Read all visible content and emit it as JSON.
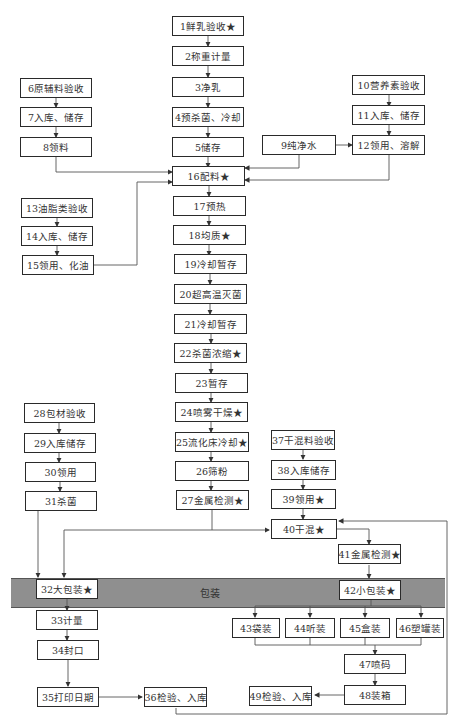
{
  "diagram": {
    "band_label": "包装",
    "nodes": [
      {
        "id": 1,
        "label": "1鲜乳验收★"
      },
      {
        "id": 2,
        "label": "2称重计量"
      },
      {
        "id": 3,
        "label": "3净乳"
      },
      {
        "id": 4,
        "label": "4预杀菌、冷却"
      },
      {
        "id": 5,
        "label": "5储存"
      },
      {
        "id": 6,
        "label": "6原辅料验收"
      },
      {
        "id": 7,
        "label": "7入库、储存"
      },
      {
        "id": 8,
        "label": "8领料"
      },
      {
        "id": 9,
        "label": "9纯净水"
      },
      {
        "id": 10,
        "label": "10营养素验收"
      },
      {
        "id": 11,
        "label": "11入库、储存"
      },
      {
        "id": 12,
        "label": "12领用、溶解"
      },
      {
        "id": 13,
        "label": "13油脂类验收"
      },
      {
        "id": 14,
        "label": "14入库、储存"
      },
      {
        "id": 15,
        "label": "15领用、化油"
      },
      {
        "id": 16,
        "label": "16配料★"
      },
      {
        "id": 17,
        "label": "17预热"
      },
      {
        "id": 18,
        "label": "18均质★"
      },
      {
        "id": 19,
        "label": "19冷却暂存"
      },
      {
        "id": 20,
        "label": "20超高温灭菌"
      },
      {
        "id": 21,
        "label": "21冷却暂存"
      },
      {
        "id": 22,
        "label": "22杀菌浓缩★"
      },
      {
        "id": 23,
        "label": "23暂存"
      },
      {
        "id": 24,
        "label": "24喷雾干燥★"
      },
      {
        "id": 25,
        "label": "25流化床冷却★"
      },
      {
        "id": 26,
        "label": "26筛粉"
      },
      {
        "id": 27,
        "label": "27金属检测★"
      },
      {
        "id": 28,
        "label": "28包材验收"
      },
      {
        "id": 29,
        "label": "29入库储存"
      },
      {
        "id": 30,
        "label": "30领用"
      },
      {
        "id": 31,
        "label": "31杀菌"
      },
      {
        "id": 32,
        "label": "32大包装★"
      },
      {
        "id": 33,
        "label": "33计量"
      },
      {
        "id": 34,
        "label": "34封口"
      },
      {
        "id": 35,
        "label": "35打印日期"
      },
      {
        "id": 36,
        "label": "36检验、入库"
      },
      {
        "id": 37,
        "label": "37干混料验收"
      },
      {
        "id": 38,
        "label": "38入库储存"
      },
      {
        "id": 39,
        "label": "39领用★"
      },
      {
        "id": 40,
        "label": "40干混★"
      },
      {
        "id": 41,
        "label": "41金属检测★"
      },
      {
        "id": 42,
        "label": "42小包装★"
      },
      {
        "id": 43,
        "label": "43袋装"
      },
      {
        "id": 44,
        "label": "44听装"
      },
      {
        "id": 45,
        "label": "45盒装"
      },
      {
        "id": 46,
        "label": "46塑罐装"
      },
      {
        "id": 47,
        "label": "47喷码"
      },
      {
        "id": 48,
        "label": "48装箱"
      },
      {
        "id": 49,
        "label": "49检验、入库"
      }
    ]
  }
}
